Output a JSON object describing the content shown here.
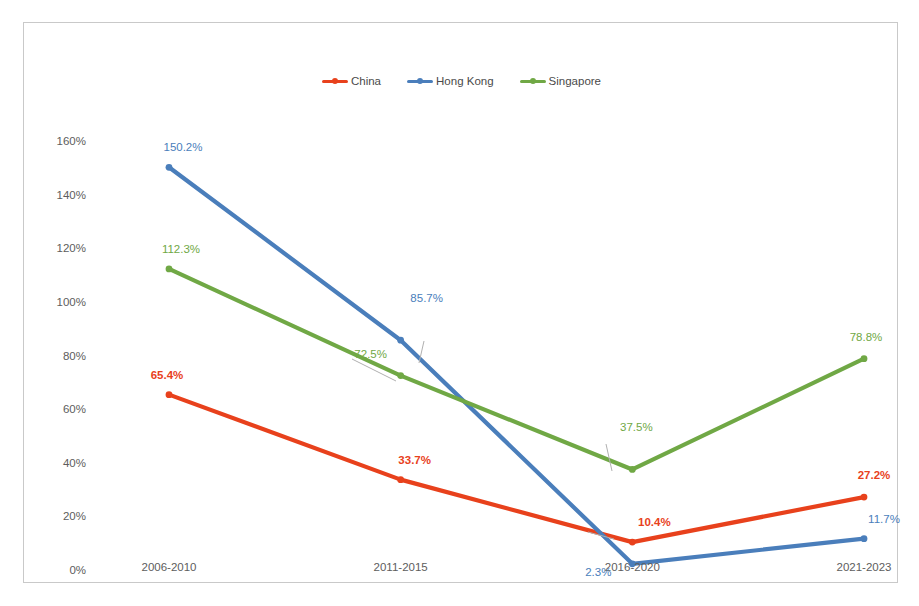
{
  "chart_data": {
    "type": "line",
    "title": "",
    "subtitle": "",
    "xlabel": "",
    "ylabel": "",
    "categories": [
      "2006-2010",
      "2011-2015",
      "2016-2020",
      "2021-2023"
    ],
    "ylim": [
      0,
      160
    ],
    "y_ticks": [
      0,
      20,
      40,
      60,
      80,
      100,
      120,
      140,
      160
    ],
    "y_tick_labels": [
      "0%",
      "20%",
      "40%",
      "60%",
      "80%",
      "100%",
      "120%",
      "140%",
      "160%"
    ],
    "grid": false,
    "legend_position": "top-center",
    "series": [
      {
        "name": "China",
        "color": "#E8411C",
        "values": [
          65.4,
          33.7,
          10.4,
          27.2
        ],
        "data_labels": [
          "65.4%",
          "33.7%",
          "10.4%",
          "27.2%"
        ],
        "label_bold": true
      },
      {
        "name": "Hong Kong",
        "color": "#4A7EBB",
        "values": [
          150.2,
          85.7,
          2.3,
          11.7
        ],
        "data_labels": [
          "150.2%",
          "85.7%",
          "2.3%",
          "11.7%"
        ],
        "label_bold": false
      },
      {
        "name": "Singapore",
        "color": "#70A845",
        "values": [
          112.3,
          72.5,
          37.5,
          78.8
        ],
        "data_labels": [
          "112.3%",
          "72.5%",
          "37.5%",
          "78.8%"
        ],
        "label_bold": false
      }
    ]
  },
  "legend": {
    "items": [
      {
        "label": "China",
        "color": "#E8411C",
        "icon": "line-marker-icon"
      },
      {
        "label": "Hong Kong",
        "color": "#4A7EBB",
        "icon": "line-marker-icon"
      },
      {
        "label": "Singapore",
        "color": "#70A845",
        "icon": "line-marker-icon"
      }
    ]
  },
  "axes": {
    "y_tick_labels": [
      "160%",
      "140%",
      "120%",
      "100%",
      "80%",
      "60%",
      "40%",
      "20%",
      "0%"
    ],
    "x_tick_labels": [
      "2006-2010",
      "2011-2015",
      "2016-2020",
      "2021-2023"
    ]
  },
  "colors": {
    "china": "#E8411C",
    "hong_kong": "#4A7EBB",
    "singapore": "#70A845",
    "axis_text": "#5d5d5d",
    "frame_border": "#c9c9c9",
    "background": "#ffffff"
  }
}
